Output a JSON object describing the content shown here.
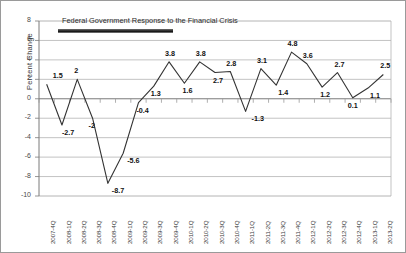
{
  "chart_data": {
    "type": "line",
    "title": "",
    "xlabel": "",
    "ylabel": "Percent Change",
    "ylim": [
      -10,
      8
    ],
    "ytick_values": [
      8,
      6,
      4,
      2,
      0,
      -2,
      -4,
      -6,
      -8,
      -10
    ],
    "ytick_labels": [
      "8",
      "6",
      "4",
      "2",
      "0",
      "-2",
      "-4",
      "-6",
      "-8",
      "-10"
    ],
    "grid": true,
    "legend": "none",
    "categories": [
      "2007-4Q",
      "2008-1Q",
      "2008-2Q",
      "2008-3Q",
      "2008-4Q",
      "2009-1Q",
      "2009-2Q",
      "2009-3Q",
      "2009-4Q",
      "2010-1Q",
      "2010-2Q",
      "2010-3Q",
      "2010-4Q",
      "2011-1Q",
      "2011-2Q",
      "2011-3Q",
      "2011-4Q",
      "2012-1Q",
      "2012-2Q",
      "2012-3Q",
      "2012-4Q",
      "2013-1Q",
      "2013-2Q"
    ],
    "values": [
      1.5,
      -2.7,
      2,
      -2,
      -8.7,
      -5.6,
      -0.4,
      1.3,
      3.8,
      1.6,
      3.8,
      2.7,
      2.8,
      -1.3,
      3.1,
      1.4,
      4.8,
      3.6,
      1.2,
      2.7,
      0.1,
      1.1,
      2.5
    ],
    "point_labels": [
      "1.5",
      "-2.7",
      "2",
      "-2",
      "-8.7",
      "-5.6",
      "-0.4",
      "1.3",
      "3.8",
      "1.6",
      "3.8",
      "2.7",
      "2.8",
      "-1.3",
      "3.1",
      "1.4",
      "4.8",
      "3.6",
      "1.2",
      "2.7",
      "0.1",
      "1.1",
      "2.5"
    ],
    "series_color": "#333333",
    "annotations": [
      {
        "name": "federal-response-annotation",
        "text": "Federal Government Response to the Financial Crisis",
        "bar_start_category": "2008-1Q",
        "bar_end_category": "2009-4Q"
      }
    ]
  }
}
